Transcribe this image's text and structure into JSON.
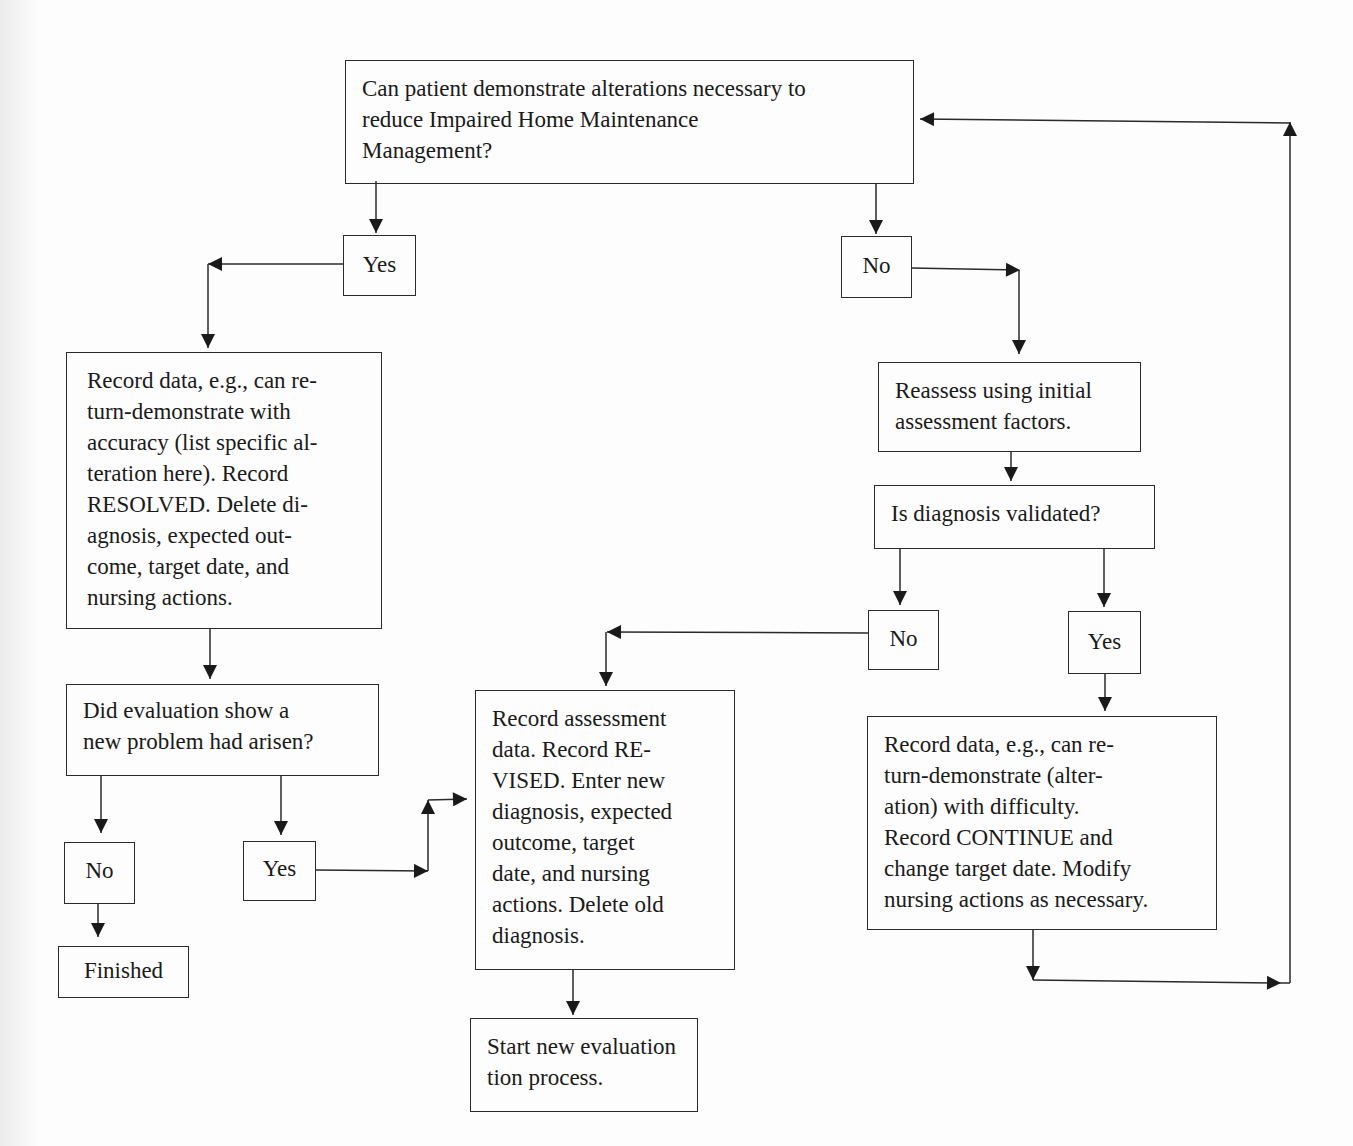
{
  "diagram": {
    "type": "flowchart",
    "nodes": {
      "start_question": "Can patient demonstrate alterations necessary to reduce Impaired Home Maintenance Management?",
      "yes_1": "Yes",
      "no_1": "No",
      "resolved_action": "Record data, e.g., can re-turn-demonstrate with accuracy (list specific al-teration here). Record RESOLVED. Delete di-agnosis, expected out-come, target date, and nursing actions.",
      "reassess": "Reassess using initial assessment factors.",
      "validated_question": "Is diagnosis validated?",
      "no_2": "No",
      "yes_2": "Yes",
      "new_problem_question": "Did evaluation show a new problem had arisen?",
      "no_3": "No",
      "yes_3": "Yes",
      "finished": "Finished",
      "revised_action": "Record assessment data. Record RE-VISED. Enter new diagnosis, expected outcome, target date, and nursing actions. Delete old diagnosis.",
      "continue_action": "Record data, e.g., can re-turn-demonstrate (alter-ation) with difficulty. Record CONTINUE and change target date. Modify nursing actions as necessary.",
      "start_new": "Start new evaluation process."
    },
    "lines": {
      "start_question": [
        "Can patient demonstrate alterations necessary to",
        "reduce Impaired Home Maintenance",
        "Management?"
      ],
      "resolved_action": [
        "Record data, e.g., can re-",
        "turn-demonstrate with",
        "accuracy (list specific al-",
        "teration here). Record",
        "RESOLVED. Delete di-",
        "agnosis, expected out-",
        "come, target date, and",
        "nursing actions."
      ],
      "reassess": [
        "Reassess using initial",
        "assessment factors."
      ],
      "new_problem_question": [
        "Did evaluation show a",
        "new problem had arisen?"
      ],
      "revised_action": [
        "Record assessment",
        "data. Record RE-",
        "VISED. Enter new",
        "diagnosis, expected",
        "outcome, target",
        "date, and nursing",
        "actions. Delete old",
        "diagnosis."
      ],
      "continue_action": [
        "Record data, e.g., can re-",
        "turn-demonstrate (alter-",
        "ation) with difficulty.",
        "Record CONTINUE and",
        "change target date. Modify",
        "nursing actions as necessary."
      ],
      "start_new": [
        "Start new evaluation",
        "tion process."
      ]
    },
    "edges": [
      {
        "from": "start_question",
        "to": "yes_1"
      },
      {
        "from": "start_question",
        "to": "no_1"
      },
      {
        "from": "yes_1",
        "to": "resolved_action"
      },
      {
        "from": "no_1",
        "to": "reassess"
      },
      {
        "from": "reassess",
        "to": "validated_question"
      },
      {
        "from": "validated_question",
        "to": "no_2"
      },
      {
        "from": "validated_question",
        "to": "yes_2"
      },
      {
        "from": "no_2",
        "to": "revised_action"
      },
      {
        "from": "yes_2",
        "to": "continue_action"
      },
      {
        "from": "continue_action",
        "to": "start_question"
      },
      {
        "from": "resolved_action",
        "to": "new_problem_question"
      },
      {
        "from": "new_problem_question",
        "to": "no_3"
      },
      {
        "from": "new_problem_question",
        "to": "yes_3"
      },
      {
        "from": "no_3",
        "to": "finished"
      },
      {
        "from": "yes_3",
        "to": "revised_action"
      },
      {
        "from": "revised_action",
        "to": "start_new"
      }
    ],
    "colors": {
      "line": "#2a2a2a",
      "background": "#fdfdfd"
    }
  }
}
